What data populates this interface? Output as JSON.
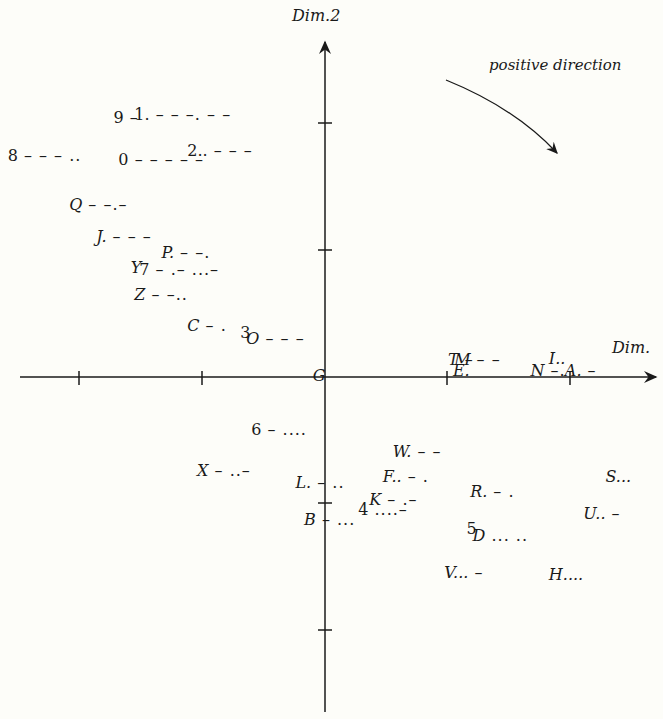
{
  "chart_data": {
    "type": "scatter",
    "title": "",
    "xlabel": "Dim.",
    "ylabel": "Dim.2",
    "annotation": "positive direction",
    "origin_label": "G",
    "grid": false,
    "legend": null,
    "axes": {
      "origin_px": [
        325,
        377
      ],
      "tick_spacing_px": 123,
      "x_ticks_px": [
        79,
        202,
        447,
        570
      ],
      "y_ticks_px": [
        123,
        250,
        503,
        630
      ]
    },
    "xlim": [
      -2.6,
      2.7
    ],
    "ylim": [
      -2.7,
      2.7
    ],
    "points": [
      {
        "label": "9",
        "pattern": "–",
        "x": -1.72,
        "y": 2.1,
        "digit": true
      },
      {
        "label": "1.",
        "pattern": "– – –. – –",
        "x": -1.55,
        "y": 2.12,
        "digit": true
      },
      {
        "label": "8",
        "pattern": "– – – ..",
        "x": -2.58,
        "y": 1.79,
        "digit": true
      },
      {
        "label": "0",
        "pattern": "– – – – –",
        "x": -1.68,
        "y": 1.76,
        "digit": true
      },
      {
        "label": "2..",
        "pattern": "– – –",
        "x": -1.12,
        "y": 1.83,
        "digit": true
      },
      {
        "label": "Q",
        "pattern": "– –.–",
        "x": -2.08,
        "y": 1.39
      },
      {
        "label": "J.",
        "pattern": "– – –",
        "x": -1.86,
        "y": 1.13
      },
      {
        "label": "P.",
        "pattern": "– –.",
        "x": -1.33,
        "y": 1.0
      },
      {
        "label": "Y",
        "pattern": "",
        "x": -1.58,
        "y": 0.88
      },
      {
        "label": "7",
        "pattern": "– .– ...–",
        "x": -1.51,
        "y": 0.86,
        "digit": true
      },
      {
        "label": "Z",
        "pattern": "– –..",
        "x": -1.55,
        "y": 0.66
      },
      {
        "label": "C",
        "pattern": "– .",
        "x": -1.12,
        "y": 0.41
      },
      {
        "label": "3",
        "pattern": "",
        "x": -0.69,
        "y": 0.35,
        "digit": true
      },
      {
        "label": "O",
        "pattern": "– – –",
        "x": -0.64,
        "y": 0.3
      },
      {
        "label": "G",
        "pattern": "",
        "x": -0.1,
        "y": 0.0
      },
      {
        "label": "T",
        "pattern": "–",
        "x": 1.0,
        "y": 0.13
      },
      {
        "label": "M",
        "pattern": "– –",
        "x": 1.05,
        "y": 0.13
      },
      {
        "label": "E.",
        "pattern": "",
        "x": 1.04,
        "y": 0.04
      },
      {
        "label": "I..",
        "pattern": "",
        "x": 1.82,
        "y": 0.14
      },
      {
        "label": "N",
        "pattern": "–.",
        "x": 1.67,
        "y": 0.04
      },
      {
        "label": "A.",
        "pattern": "–",
        "x": 1.95,
        "y": 0.04
      },
      {
        "label": "6",
        "pattern": "– ....",
        "x": -0.6,
        "y": -0.44,
        "digit": true
      },
      {
        "label": "W.",
        "pattern": "– –",
        "x": 0.55,
        "y": -0.62
      },
      {
        "label": "X",
        "pattern": "– ..–",
        "x": -1.04,
        "y": -0.77
      },
      {
        "label": "L.",
        "pattern": "– ..",
        "x": -0.24,
        "y": -0.87
      },
      {
        "label": "F..",
        "pattern": "– .",
        "x": 0.47,
        "y": -0.82
      },
      {
        "label": "R.",
        "pattern": "– .",
        "x": 1.18,
        "y": -0.94
      },
      {
        "label": "S...",
        "pattern": "",
        "x": 2.28,
        "y": -0.82
      },
      {
        "label": "K",
        "pattern": "– .–",
        "x": 0.36,
        "y": -1.01
      },
      {
        "label": "4",
        "pattern": "....–",
        "x": 0.27,
        "y": -1.09,
        "digit": true
      },
      {
        "label": "U..",
        "pattern": "–",
        "x": 2.1,
        "y": -1.12
      },
      {
        "label": "B",
        "pattern": "– ...",
        "x": -0.17,
        "y": -1.17
      },
      {
        "label": "5",
        "pattern": "",
        "x": 1.15,
        "y": -1.24,
        "digit": true
      },
      {
        "label": "D",
        "pattern": "... ..",
        "x": 1.2,
        "y": -1.3
      },
      {
        "label": "V...",
        "pattern": "–",
        "x": 0.97,
        "y": -1.6
      },
      {
        "label": "H....",
        "pattern": "",
        "x": 1.82,
        "y": -1.62
      }
    ]
  },
  "labels": {
    "y_axis_title": "Dim.2",
    "x_axis_title": "Dim.",
    "annotation": "positive direction"
  },
  "colors": {
    "ink": "#1a1a1a",
    "background": "#fdfdf9"
  }
}
